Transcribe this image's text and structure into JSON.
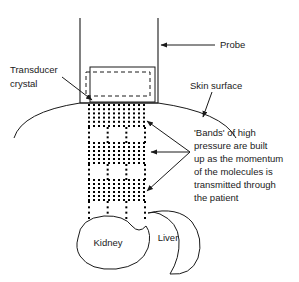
{
  "figure": {
    "background_color": "#ffffff",
    "ink_color": "#1a1a1a"
  },
  "labels": {
    "probe": "Probe",
    "transducer_line1": "Transducer",
    "transducer_line2": "crystal",
    "skin_surface": "Skin surface",
    "kidney": "Kidney",
    "liver": "Liver"
  },
  "annotation": {
    "lines": [
      "'Bands' of high",
      "pressure are built",
      "up as the momentum",
      "of the molecules is",
      "transmitted through",
      "the patient"
    ]
  },
  "chart_data": {
    "type": "diagram",
    "elements": [
      {
        "name": "probe",
        "shape": "open-rectangle",
        "x": 80,
        "y": 18,
        "width": 78,
        "height": 85
      },
      {
        "name": "transducer-crystal-solid",
        "shape": "rectangle",
        "x": 90,
        "y": 67,
        "width": 65,
        "height": 35
      },
      {
        "name": "transducer-crystal-dashed",
        "shape": "dashed-rectangle",
        "x": 86,
        "y": 72,
        "width": 64,
        "height": 24
      },
      {
        "name": "skin-surface",
        "shape": "arc",
        "apex_x": 120,
        "apex_y": 103,
        "left_x": 14,
        "right_x": 236,
        "end_y": 138
      },
      {
        "name": "kidney",
        "shape": "bean",
        "cx": 108,
        "cy": 243
      },
      {
        "name": "liver",
        "shape": "crescent",
        "cx": 152,
        "cy": 240
      }
    ],
    "pressure_bands": [
      {
        "index": 1,
        "type": "dense",
        "y_top": 105,
        "y_bottom": 126,
        "columns": 12,
        "rows": 6
      },
      {
        "index": 2,
        "type": "sparse",
        "y_top": 128,
        "y_bottom": 142,
        "columns": 4,
        "rows": 4
      },
      {
        "index": 3,
        "type": "dense",
        "y_top": 143,
        "y_bottom": 163,
        "columns": 12,
        "rows": 6
      },
      {
        "index": 4,
        "type": "sparse",
        "y_top": 165,
        "y_bottom": 179,
        "columns": 4,
        "rows": 4
      },
      {
        "index": 5,
        "type": "dense",
        "y_top": 180,
        "y_bottom": 200,
        "columns": 12,
        "rows": 6
      },
      {
        "index": 6,
        "type": "sparse",
        "y_top": 202,
        "y_bottom": 218,
        "columns": 4,
        "rows": 4
      }
    ],
    "dot_field": {
      "x_left": 89,
      "x_right": 145,
      "dense_col_spacing": 5,
      "sparse_col_spacing": 15,
      "row_spacing": 4,
      "dot_size": 2
    },
    "arrows": [
      {
        "from": "probe-label",
        "to": "probe-right-edge",
        "x1": 215,
        "y1": 45,
        "x2": 160,
        "y2": 45
      },
      {
        "from": "transducer-label",
        "to": "crystal-corner",
        "x1": 62,
        "y1": 77,
        "x2": 92,
        "y2": 100
      },
      {
        "from": "skin-label",
        "to": "skin-curve",
        "x1": 212,
        "y1": 93,
        "x2": 203,
        "y2": 117
      },
      {
        "from": "annotation-vertex",
        "to": "band-1",
        "x1": 190,
        "y1": 152,
        "x2": 146,
        "y2": 120
      },
      {
        "from": "annotation-vertex",
        "to": "band-2",
        "x1": 190,
        "y1": 152,
        "x2": 150,
        "y2": 152
      },
      {
        "from": "annotation-vertex",
        "to": "band-3",
        "x1": 190,
        "y1": 152,
        "x2": 146,
        "y2": 190
      }
    ]
  }
}
